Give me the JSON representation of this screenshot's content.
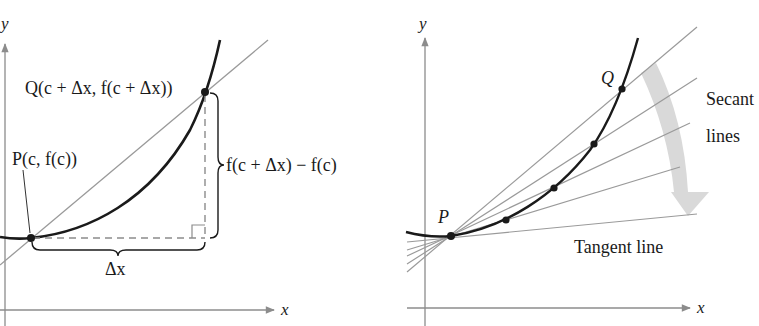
{
  "left_figure": {
    "title": "Secant line through P and Q",
    "axis_x_label": "x",
    "axis_y_label": "y",
    "point_p_label": "P(c, f(c))",
    "point_q_label": "Q(c + Δx, f(c + Δx))",
    "rise_label": "f(c + Δx) − f(c)",
    "run_label": "Δx"
  },
  "right_figure": {
    "title": "Secant lines approaching tangent line",
    "axis_x_label": "x",
    "axis_y_label": "y",
    "point_p_label": "P",
    "point_q_label": "Q",
    "secant_label_line1": "Secant",
    "secant_label_line2": "lines",
    "tangent_label": "Tangent line"
  },
  "colors": {
    "curve": "#1a1a1a",
    "axis": "#8c8c8c",
    "secant": "#9a9a9a",
    "dashed": "#8c8c8c",
    "arrow_fill": "#d9d9d9"
  }
}
